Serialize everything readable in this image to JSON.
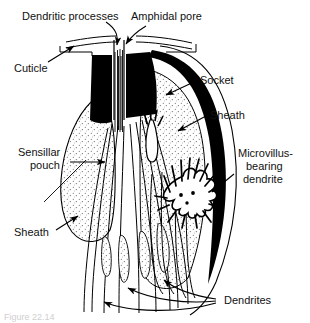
{
  "figure": {
    "background_color": "#ffffff",
    "ink_color": "#000000",
    "stipple_fill_color": "#f2f2f2",
    "labels": {
      "dendritic_processes": "Dendritic processes",
      "amphidal_pore": "Amphidal pore",
      "cuticle": "Cuticle",
      "socket": "Socket",
      "sheath_right": "Sheath",
      "sensillar_pouch_line1": "Sensillar",
      "sensillar_pouch_line2": "pouch",
      "microvillus_line1": "Microvillus-",
      "microvillus_line2": "bearing",
      "microvillus_line3": "dendrite",
      "sheath_left": "Sheath",
      "dendrites": "Dendrites"
    }
  },
  "caption": {
    "text": "Figure 22.14"
  }
}
